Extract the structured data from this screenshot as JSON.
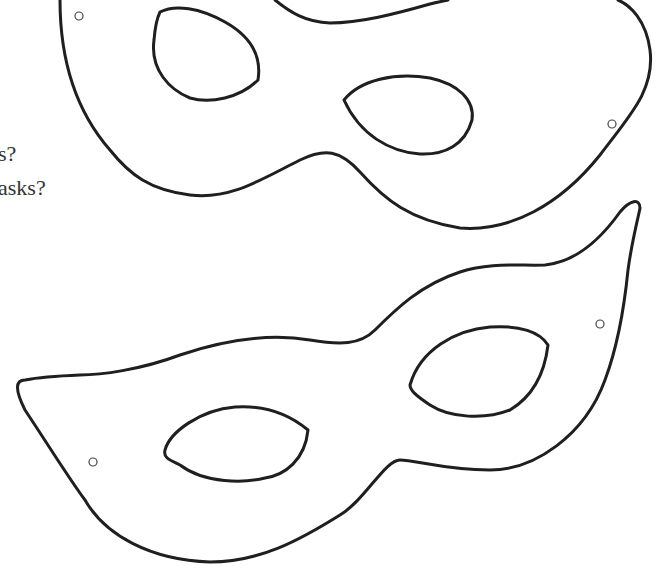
{
  "document": {
    "questions": [
      {
        "text": "s?"
      },
      {
        "text": "asks?"
      }
    ],
    "masks": [
      {
        "name": "upper-mask",
        "eye_holes": 2,
        "string_holes": 2
      },
      {
        "name": "lower-mask",
        "eye_holes": 2,
        "string_holes": 2
      }
    ],
    "colors": {
      "background": "#ffffff",
      "outline": "#1f1f1f",
      "text": "#333333"
    }
  }
}
